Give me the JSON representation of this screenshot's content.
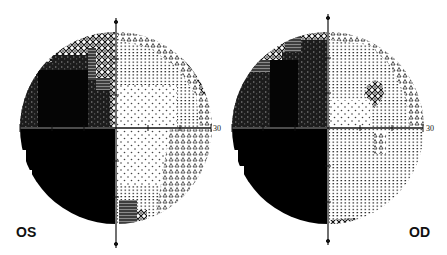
{
  "figure": {
    "type": "visual-field-greyscale",
    "plots": [
      {
        "eye": "OS",
        "label": "OS",
        "axis_label": "30",
        "center": {
          "x": 116,
          "y": 128
        },
        "radius": 96,
        "description": "Dense superior-temporal (upper-left) and complete inferior-temporal (lower-left) defect; mild loss along superior-nasal edge; small dense patch inferior near vertical meridian"
      },
      {
        "eye": "OD",
        "label": "OD",
        "axis_label": "30",
        "center": {
          "x": 328,
          "y": 128
        },
        "radius": 96,
        "description": "Dense superior-temporal and complete inferior-temporal defect; small paracentral scotoma right of fixation; small patch inferior near vertical meridian"
      }
    ],
    "colors": {
      "background": "#ffffff",
      "dense": "#000000",
      "dark_gray": "#3a3a3a",
      "mid_gray": "#7a7a7a",
      "light_dot": "#555555",
      "axis": "#111111"
    }
  }
}
